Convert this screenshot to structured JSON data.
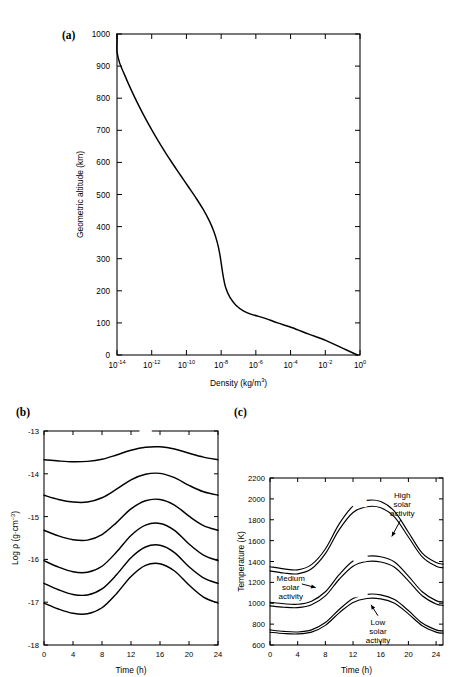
{
  "figure": {
    "panels": [
      {
        "tag": "(a)",
        "id": "panel-a"
      },
      {
        "tag": "(b)",
        "id": "panel-b"
      },
      {
        "tag": "(c)",
        "id": "panel-c"
      }
    ]
  },
  "chart_data": [
    {
      "id": "panel-a",
      "type": "line",
      "title": "",
      "panel_tag": "(a)",
      "xlabel": "Density (kg/m3)",
      "xlabel_base": "Density (kg/m",
      "xlabel_sup": "3",
      "xlabel_tail": ")",
      "ylabel": "Geometric altitude (km)",
      "xscale": "log",
      "xlim": [
        -14,
        0
      ],
      "ylim": [
        0,
        1000
      ],
      "grid": false,
      "legend": "none",
      "xticks": [
        -14,
        -12,
        -10,
        -8,
        -6,
        -4,
        -2,
        0
      ],
      "xtick_labels": [
        "10-14",
        "10-12",
        "10-10",
        "10-8",
        "10-6",
        "10-4",
        "10-2",
        "100"
      ],
      "xtick_mantissa": "10",
      "xtick_exponents": [
        "-14",
        "-12",
        "-10",
        "-8",
        "-6",
        "-4",
        "-2",
        "0"
      ],
      "yticks": [
        0,
        100,
        200,
        300,
        400,
        500,
        600,
        700,
        800,
        900,
        1000
      ],
      "ytick_labels": [
        "0",
        "100",
        "200",
        "300",
        "400",
        "500",
        "600",
        "700",
        "800",
        "900",
        "1000"
      ],
      "series": [
        {
          "name": "US Standard Atmosphere density profile",
          "x_log10_density": [
            -14.45,
            -14.3,
            -14.1,
            -13.85,
            -13.58,
            -13.3,
            -13.0,
            -12.68,
            -12.34,
            -11.98,
            -11.6,
            -11.2,
            -10.78,
            -10.34,
            -9.9,
            -9.46,
            -9.05,
            -8.7,
            -8.42,
            -8.22,
            -8.08,
            -7.98,
            -7.88,
            -7.74,
            -7.5,
            -7.15,
            -6.7,
            -6.15,
            -5.5,
            -4.75,
            -3.9,
            -2.95,
            -1.95,
            -0.95,
            -0.15
          ],
          "y_altitude_km": [
            1000,
            975,
            945,
            910,
            875,
            840,
            805,
            770,
            735,
            700,
            665,
            630,
            595,
            560,
            525,
            490,
            455,
            420,
            385,
            350,
            315,
            280,
            245,
            210,
            180,
            155,
            137,
            125,
            115,
            100,
            85,
            65,
            45,
            20,
            0
          ]
        }
      ]
    },
    {
      "id": "panel-b",
      "type": "line",
      "panel_tag": "(b)",
      "xlabel": "Time (h)",
      "ylabel": "Log p (g*cm-3)",
      "ylabel_base": "Log ρ (g·cm",
      "ylabel_sup": "−3",
      "ylabel_tail": ")",
      "xlim": [
        0,
        24
      ],
      "ylim": [
        -18,
        -13
      ],
      "grid": false,
      "legend": "inline-curve-labels",
      "legend_header": "km",
      "xticks": [
        0,
        4,
        8,
        12,
        16,
        20,
        24
      ],
      "xtick_labels": [
        "0",
        "4",
        "8",
        "12",
        "16",
        "20",
        "24"
      ],
      "yticks": [
        -18,
        -17,
        -16,
        -15,
        -14,
        -13
      ],
      "ytick_labels": [
        "-18",
        "-17",
        "-16",
        "-15",
        "-14",
        "-13"
      ],
      "x_hours": [
        0,
        2,
        4,
        6,
        8,
        10,
        12,
        14,
        16,
        18,
        20,
        22,
        24
      ],
      "series": [
        {
          "name": "300",
          "label": "300",
          "values": [
            -13.67,
            -13.7,
            -13.72,
            -13.71,
            -13.66,
            -13.56,
            -13.45,
            -13.38,
            -13.37,
            -13.42,
            -13.52,
            -13.61,
            -13.67
          ]
        },
        {
          "name": "400",
          "label": "400",
          "values": [
            -14.5,
            -14.6,
            -14.66,
            -14.66,
            -14.56,
            -14.36,
            -14.14,
            -14.01,
            -13.99,
            -14.09,
            -14.27,
            -14.42,
            -14.5
          ]
        },
        {
          "name": "500",
          "label": "500",
          "values": [
            -15.32,
            -15.45,
            -15.54,
            -15.55,
            -15.42,
            -15.14,
            -14.82,
            -14.63,
            -14.6,
            -14.73,
            -14.99,
            -15.21,
            -15.32
          ]
        },
        {
          "name": "600",
          "label": "600",
          "values": [
            -16.03,
            -16.18,
            -16.29,
            -16.3,
            -16.16,
            -15.83,
            -15.44,
            -15.2,
            -15.16,
            -15.32,
            -15.64,
            -15.9,
            -16.03
          ]
        },
        {
          "name": "700",
          "label": "700",
          "values": [
            -16.56,
            -16.71,
            -16.82,
            -16.83,
            -16.69,
            -16.36,
            -15.96,
            -15.71,
            -15.67,
            -15.84,
            -16.17,
            -16.43,
            -16.56
          ]
        },
        {
          "name": "800",
          "label": "800",
          "values": [
            -17.02,
            -17.16,
            -17.26,
            -17.27,
            -17.13,
            -16.8,
            -16.4,
            -16.14,
            -16.1,
            -16.27,
            -16.6,
            -16.88,
            -17.02
          ]
        }
      ]
    },
    {
      "id": "panel-c",
      "type": "line",
      "panel_tag": "(c)",
      "xlabel": "Time (h)",
      "ylabel": "Temperature (K)",
      "xlim": [
        0,
        25
      ],
      "ylim": [
        600,
        2200
      ],
      "grid": false,
      "legend": "inline-curve-labels",
      "legend_header": "km",
      "xticks": [
        0,
        4,
        8,
        12,
        16,
        20,
        24
      ],
      "xtick_labels": [
        "0",
        "4",
        "8",
        "12",
        "16",
        "20",
        "24"
      ],
      "yticks": [
        600,
        800,
        1000,
        1200,
        1400,
        1600,
        1800,
        2000,
        2200
      ],
      "ytick_labels": [
        "600",
        "800",
        "1000",
        "1200",
        "1400",
        "1600",
        "1800",
        "2000",
        "2200"
      ],
      "x_hours": [
        0,
        2,
        4,
        6,
        8,
        10,
        12,
        14,
        16,
        18,
        20,
        22,
        24,
        25
      ],
      "annotations": [
        {
          "id": "high",
          "text_lines": [
            "High",
            "solar",
            "activity"
          ],
          "text": "High solar activity"
        },
        {
          "id": "medium",
          "text_lines": [
            "Medium",
            "solar",
            "activity"
          ],
          "text": "Medium solar activity"
        },
        {
          "id": "low",
          "text_lines": [
            "Low",
            "solar",
            "activity"
          ],
          "text": "Low solar activity"
        }
      ],
      "series": [
        {
          "name": "high-600",
          "label": "600",
          "group": "High solar activity",
          "altitude_km": 600,
          "values": [
            1350,
            1330,
            1320,
            1370,
            1520,
            1760,
            1930,
            1985,
            1975,
            1880,
            1680,
            1480,
            1390,
            1375
          ]
        },
        {
          "name": "high-300",
          "label": "300",
          "group": "High solar activity",
          "altitude_km": 300,
          "values": [
            1310,
            1290,
            1282,
            1330,
            1475,
            1705,
            1870,
            1925,
            1915,
            1825,
            1635,
            1445,
            1355,
            1340
          ]
        },
        {
          "name": "medium-600",
          "label": "600",
          "group": "Medium solar activity",
          "altitude_km": 600,
          "values": [
            1010,
            995,
            990,
            1020,
            1110,
            1275,
            1405,
            1450,
            1445,
            1395,
            1260,
            1110,
            1025,
            1012
          ]
        },
        {
          "name": "medium-300",
          "label": "300",
          "group": "Medium solar activity",
          "altitude_km": 300,
          "values": [
            975,
            962,
            958,
            985,
            1070,
            1230,
            1355,
            1400,
            1395,
            1345,
            1215,
            1072,
            992,
            980
          ]
        },
        {
          "name": "low-600",
          "label": "600",
          "group": "Low solar activity",
          "altitude_km": 600,
          "values": [
            745,
            730,
            725,
            745,
            815,
            940,
            1045,
            1085,
            1080,
            1035,
            930,
            810,
            745,
            735
          ]
        },
        {
          "name": "low-300",
          "label": "300",
          "group": "Low solar activity",
          "altitude_km": 300,
          "values": [
            722,
            710,
            706,
            723,
            788,
            908,
            1008,
            1046,
            1042,
            999,
            898,
            784,
            723,
            714
          ]
        }
      ]
    }
  ]
}
